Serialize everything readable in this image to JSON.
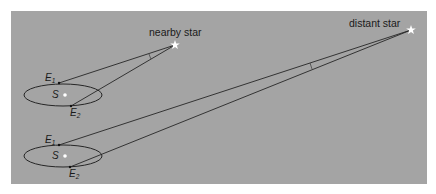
{
  "diagram": {
    "colors": {
      "panel_background": "#a4a4a4",
      "page_background": "#ffffff",
      "line": "#262626",
      "star": "#ffffff",
      "sun": "#ffffff"
    },
    "labels": {
      "nearby_star": "nearby star",
      "distant_star": "distant star",
      "sun": "S",
      "earth_letter": "E",
      "earth1_sub": "1",
      "earth2_sub": "2"
    },
    "scenes": [
      {
        "name": "nearby",
        "orbit": {
          "cx": 63,
          "cy": 95,
          "rx": 39,
          "ry": 11
        },
        "sun": {
          "x": 65,
          "y": 95
        },
        "e1": {
          "x": 59,
          "y": 83
        },
        "e2": {
          "x": 71,
          "y": 106
        },
        "star": {
          "x": 175,
          "y": 45
        }
      },
      {
        "name": "distant",
        "orbit": {
          "cx": 63,
          "cy": 156,
          "rx": 39,
          "ry": 11
        },
        "sun": {
          "x": 65,
          "y": 156
        },
        "e1": {
          "x": 59,
          "y": 145
        },
        "e2": {
          "x": 70,
          "y": 167
        },
        "star": {
          "x": 411,
          "y": 30
        }
      }
    ]
  }
}
